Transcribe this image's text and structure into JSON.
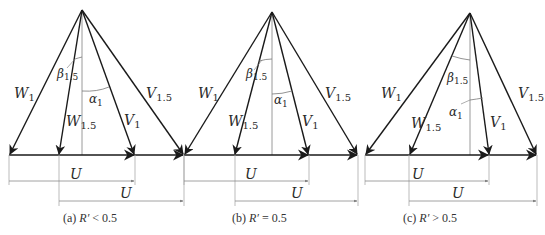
{
  "figure": {
    "panels": [
      {
        "id": "a",
        "caption_prefix": "(a)",
        "caption_var": "R′",
        "caption_rel": "< 0.5",
        "apex": [
          82,
          10
        ],
        "baseline_y": 155,
        "w1_x": 9,
        "w15_x": 59,
        "axis_x": 82,
        "v1_x": 135,
        "v15_x": 184,
        "u1_y": 181,
        "u2_y": 201,
        "labels": {
          "W1": "W",
          "W1_sub": "1",
          "W15": "W",
          "W15_sub": "1.5",
          "V1": "V",
          "V1_sub": "1",
          "V15": "V",
          "V15_sub": "1.5",
          "beta": "β",
          "beta_sub": "1.5",
          "alpha": "α",
          "alpha_sub": "1",
          "U_upper": "U",
          "U_lower": "U"
        }
      },
      {
        "id": "b",
        "caption_prefix": "(b)",
        "caption_var": "R′",
        "caption_rel": "= 0.5",
        "apex": [
          272,
          12
        ],
        "baseline_y": 155,
        "w1_x": 184,
        "w15_x": 235,
        "axis_x": 272,
        "v1_x": 309,
        "v15_x": 358,
        "u1_y": 181,
        "u2_y": 201,
        "labels": {
          "W1": "W",
          "W1_sub": "1",
          "W15": "W",
          "W15_sub": "1.5",
          "V1": "V",
          "V1_sub": "1",
          "V15": "V",
          "V15_sub": "1.5",
          "beta": "β",
          "beta_sub": "1.5",
          "alpha": "α",
          "alpha_sub": "1",
          "U_upper": "U",
          "U_lower": "U"
        }
      },
      {
        "id": "c",
        "caption_prefix": "(c)",
        "caption_var": "R′",
        "caption_rel": "> 0.5",
        "apex": [
          470,
          13
        ],
        "baseline_y": 155,
        "w1_x": 365,
        "w15_x": 409,
        "axis_x": 470,
        "v1_x": 489,
        "v15_x": 537,
        "u1_y": 181,
        "u2_y": 201,
        "labels": {
          "W1": "W",
          "W1_sub": "1",
          "W15": "W",
          "W15_sub": "1.5",
          "V1": "V",
          "V1_sub": "1",
          "V15": "V",
          "V15_sub": "1.5",
          "beta": "β",
          "beta_sub": "1.5",
          "alpha": "α",
          "alpha_sub": "1",
          "U_upper": "U",
          "U_lower": "U"
        }
      }
    ],
    "colors": {
      "vector": "#1a1a1a",
      "axis": "#9a9a9a",
      "dimension": "#8a8a8a",
      "text": "#2a2a2a"
    }
  }
}
